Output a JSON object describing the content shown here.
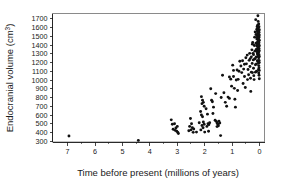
{
  "chart_data": {
    "type": "scatter",
    "title": "",
    "xlabel": "Time before present (millions of years)",
    "ylabel": "Endocranial volume (cm³)",
    "ylabel_base": "Endocranial volume (cm",
    "ylabel_sup": "3",
    "ylabel_close": ")",
    "xlim": [
      7.55,
      -0.18
    ],
    "ylim": [
      292,
      1760
    ],
    "x_reversed": true,
    "grid": false,
    "legend": null,
    "xticks": [
      7,
      6,
      5,
      4,
      3,
      2,
      1,
      0
    ],
    "xtick_labels": [
      "7",
      "6",
      "5",
      "4",
      "3",
      "2",
      "1",
      "0"
    ],
    "x_minor_ticks": [
      6.5,
      5.5,
      4.5,
      3.5,
      2.5,
      1.5,
      0.5
    ],
    "yticks": [
      300,
      400,
      500,
      600,
      700,
      800,
      900,
      1000,
      1100,
      1200,
      1300,
      1400,
      1500,
      1600,
      1700
    ],
    "ytick_labels": [
      "300",
      "400",
      "500",
      "600",
      "700",
      "800",
      "900",
      "1000",
      "1100",
      "1200",
      "1300",
      "1400",
      "1500",
      "1600",
      "1700"
    ],
    "marker": "dot",
    "marker_color": "#111111",
    "marker_size": 1.45,
    "points": [
      [
        6.95,
        360
      ],
      [
        4.42,
        310
      ],
      [
        3.22,
        545
      ],
      [
        3.18,
        495
      ],
      [
        3.15,
        438
      ],
      [
        3.1,
        500
      ],
      [
        3.05,
        452
      ],
      [
        3.02,
        415
      ],
      [
        2.98,
        400
      ],
      [
        2.96,
        388
      ],
      [
        3.0,
        470
      ],
      [
        3.08,
        425
      ],
      [
        2.52,
        560
      ],
      [
        2.48,
        500
      ],
      [
        2.45,
        455
      ],
      [
        2.5,
        430
      ],
      [
        2.58,
        420
      ],
      [
        2.42,
        402
      ],
      [
        2.4,
        440
      ],
      [
        2.55,
        470
      ],
      [
        2.12,
        810
      ],
      [
        2.08,
        770
      ],
      [
        2.05,
        745
      ],
      [
        2.1,
        730
      ],
      [
        2.02,
        700
      ],
      [
        2.15,
        640
      ],
      [
        2.12,
        600
      ],
      [
        2.08,
        580
      ],
      [
        2.05,
        520
      ],
      [
        2.02,
        495
      ],
      [
        2.1,
        480
      ],
      [
        2.06,
        455
      ],
      [
        2.14,
        430
      ],
      [
        2.0,
        405
      ],
      [
        1.95,
        672
      ],
      [
        1.9,
        610
      ],
      [
        1.88,
        500
      ],
      [
        1.85,
        490
      ],
      [
        1.92,
        470
      ],
      [
        1.82,
        512
      ],
      [
        1.78,
        900
      ],
      [
        1.75,
        770
      ],
      [
        1.72,
        752
      ],
      [
        1.68,
        690
      ],
      [
        1.62,
        540
      ],
      [
        1.58,
        528
      ],
      [
        1.55,
        510
      ],
      [
        1.52,
        495
      ],
      [
        1.5,
        478
      ],
      [
        1.55,
        468
      ],
      [
        1.48,
        530
      ],
      [
        1.45,
        508
      ],
      [
        1.42,
        365
      ],
      [
        1.4,
        800
      ],
      [
        1.35,
        1055
      ],
      [
        1.3,
        855
      ],
      [
        1.25,
        745
      ],
      [
        1.2,
        700
      ],
      [
        1.15,
        805
      ],
      [
        1.1,
        790
      ],
      [
        1.05,
        1010
      ],
      [
        1.02,
        930
      ],
      [
        0.98,
        1170
      ],
      [
        0.95,
        1040
      ],
      [
        0.92,
        905
      ],
      [
        0.9,
        780
      ],
      [
        0.88,
        690
      ],
      [
        0.85,
        1000
      ],
      [
        0.82,
        1115
      ],
      [
        0.78,
        1008
      ],
      [
        0.72,
        1215
      ],
      [
        0.68,
        1160
      ],
      [
        0.65,
        1085
      ],
      [
        0.62,
        1220
      ],
      [
        0.58,
        1125
      ],
      [
        0.55,
        1040
      ],
      [
        0.52,
        915
      ],
      [
        0.5,
        1255
      ],
      [
        0.48,
        1185
      ],
      [
        0.45,
        1285
      ],
      [
        0.42,
        1120
      ],
      [
        0.4,
        1060
      ],
      [
        0.38,
        1225
      ],
      [
        0.36,
        1305
      ],
      [
        0.35,
        1155
      ],
      [
        0.33,
        1020
      ],
      [
        0.32,
        870
      ],
      [
        0.3,
        1265
      ],
      [
        0.28,
        1345
      ],
      [
        0.27,
        1190
      ],
      [
        0.26,
        1085
      ],
      [
        0.25,
        1430
      ],
      [
        0.24,
        1305
      ],
      [
        0.23,
        1230
      ],
      [
        0.22,
        1135
      ],
      [
        0.21,
        1050
      ],
      [
        0.2,
        1005
      ],
      [
        0.19,
        1395
      ],
      [
        0.18,
        1490
      ],
      [
        0.17,
        1330
      ],
      [
        0.16,
        1245
      ],
      [
        0.15,
        1175
      ],
      [
        0.15,
        1090
      ],
      [
        0.14,
        1690
      ],
      [
        0.13,
        1520
      ],
      [
        0.13,
        1420
      ],
      [
        0.12,
        1350
      ],
      [
        0.12,
        1265
      ],
      [
        0.11,
        1185
      ],
      [
        0.11,
        1100
      ],
      [
        0.1,
        1580
      ],
      [
        0.1,
        1470
      ],
      [
        0.1,
        1390
      ],
      [
        0.09,
        1610
      ],
      [
        0.09,
        1505
      ],
      [
        0.09,
        1425
      ],
      [
        0.09,
        1330
      ],
      [
        0.08,
        1560
      ],
      [
        0.08,
        1480
      ],
      [
        0.08,
        1400
      ],
      [
        0.08,
        1310
      ],
      [
        0.08,
        1220
      ],
      [
        0.07,
        1625
      ],
      [
        0.07,
        1540
      ],
      [
        0.07,
        1465
      ],
      [
        0.07,
        1380
      ],
      [
        0.07,
        1295
      ],
      [
        0.06,
        1735
      ],
      [
        0.06,
        1585
      ],
      [
        0.06,
        1510
      ],
      [
        0.06,
        1440
      ],
      [
        0.06,
        1355
      ],
      [
        0.06,
        1270
      ],
      [
        0.05,
        1670
      ],
      [
        0.05,
        1555
      ],
      [
        0.05,
        1495
      ],
      [
        0.05,
        1430
      ],
      [
        0.05,
        1365
      ],
      [
        0.05,
        1300
      ],
      [
        0.05,
        1215
      ],
      [
        0.04,
        1600
      ],
      [
        0.04,
        1530
      ],
      [
        0.04,
        1470
      ],
      [
        0.04,
        1410
      ],
      [
        0.04,
        1345
      ],
      [
        0.04,
        1280
      ],
      [
        0.04,
        1195
      ],
      [
        0.04,
        1120
      ],
      [
        0.03,
        1640
      ],
      [
        0.03,
        1565
      ],
      [
        0.03,
        1500
      ],
      [
        0.03,
        1445
      ],
      [
        0.03,
        1385
      ],
      [
        0.03,
        1320
      ],
      [
        0.03,
        1255
      ],
      [
        0.03,
        1165
      ],
      [
        0.03,
        1080
      ],
      [
        0.02,
        1610
      ],
      [
        0.02,
        1545
      ],
      [
        0.02,
        1485
      ],
      [
        0.02,
        1425
      ],
      [
        0.02,
        1360
      ],
      [
        0.02,
        1290
      ],
      [
        0.02,
        1225
      ],
      [
        0.02,
        1140
      ],
      [
        0.02,
        1055
      ],
      [
        0.01,
        1575
      ],
      [
        0.01,
        1515
      ],
      [
        0.01,
        1455
      ],
      [
        0.01,
        1395
      ],
      [
        0.01,
        1335
      ],
      [
        0.01,
        1270
      ],
      [
        0.01,
        1200
      ],
      [
        0.01,
        1110
      ],
      [
        0.01,
        1015
      ],
      [
        0.16,
        1550
      ],
      [
        0.18,
        1240
      ],
      [
        0.22,
        1290
      ],
      [
        0.26,
        1410
      ],
      [
        0.3,
        1090
      ],
      [
        0.34,
        1245
      ],
      [
        0.44,
        1005
      ],
      [
        0.55,
        1180
      ],
      [
        0.6,
        960
      ],
      [
        0.75,
        1100
      ],
      [
        0.8,
        880
      ],
      [
        0.95,
        1110
      ],
      [
        1.1,
        1035
      ],
      [
        1.6,
        845
      ],
      [
        1.7,
        618
      ],
      [
        1.86,
        415
      ],
      [
        2.2,
        512
      ],
      [
        2.3,
        405
      ]
    ]
  }
}
